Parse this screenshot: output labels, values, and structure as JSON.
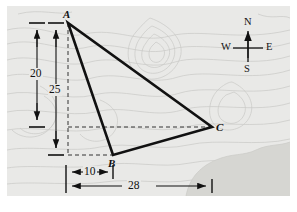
{
  "figure": {
    "background_color": "#e9e9e7",
    "contour_color": "#c9c9c5",
    "shaded_region_color": "#d6d6d2",
    "line_color": "#111111",
    "dashed_color": "#333333"
  },
  "vertices": [
    {
      "id": "A",
      "label": "A",
      "x": 68,
      "y": 23
    },
    {
      "id": "B",
      "label": "B",
      "x": 113,
      "y": 155
    },
    {
      "id": "C",
      "label": "C",
      "x": 212,
      "y": 127
    }
  ],
  "dimensions": [
    {
      "name": "vertical-20",
      "value": "20",
      "orientation": "vertical",
      "from_y": 23,
      "to_y": 127,
      "axis_x": 37
    },
    {
      "name": "vertical-25",
      "value": "25",
      "orientation": "vertical",
      "from_y": 23,
      "to_y": 155,
      "axis_x": 56
    },
    {
      "name": "horizontal-10",
      "value": "10",
      "orientation": "horizontal",
      "from_x": 66,
      "to_x": 113,
      "axis_y": 172
    },
    {
      "name": "horizontal-28",
      "value": "28",
      "orientation": "horizontal",
      "from_x": 66,
      "to_x": 212,
      "axis_y": 186
    }
  ],
  "compass": {
    "north": "N",
    "south": "S",
    "east": "E",
    "west": "W",
    "center_x": 248,
    "center_y": 48
  }
}
